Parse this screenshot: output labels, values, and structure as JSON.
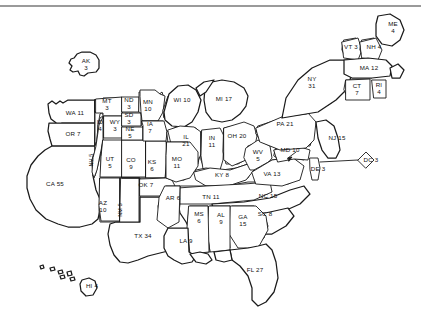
{
  "figure": {
    "type": "cartogram-map",
    "title": "",
    "background_color": "#ffffff",
    "outline_color": "#1a1a1a",
    "rule_color": "#9a9a9a",
    "total_electoral_votes": 538
  },
  "chart_data": {
    "type": "map",
    "title": "",
    "value_label": "Electoral Votes",
    "states": [
      {
        "abbr": "AK",
        "value": 3,
        "layout": "stacked",
        "x": 86,
        "y": 65
      },
      {
        "abbr": "WA",
        "value": 11,
        "layout": "inline",
        "x": 75,
        "y": 113
      },
      {
        "abbr": "OR",
        "value": 7,
        "layout": "inline",
        "x": 73,
        "y": 134
      },
      {
        "abbr": "MT",
        "value": 3,
        "layout": "stacked",
        "x": 107,
        "y": 105
      },
      {
        "abbr": "ND",
        "value": 3,
        "layout": "stacked",
        "x": 129,
        "y": 104
      },
      {
        "abbr": "MN",
        "value": 10,
        "layout": "stacked",
        "x": 148,
        "y": 106
      },
      {
        "abbr": "WI",
        "value": 10,
        "layout": "inline",
        "x": 182,
        "y": 100
      },
      {
        "abbr": "MI",
        "value": 17,
        "layout": "inline",
        "x": 224,
        "y": 99
      },
      {
        "abbr": "ID",
        "value": 4,
        "layout": "stacked",
        "x": 100,
        "y": 126
      },
      {
        "abbr": "WY",
        "value": 3,
        "layout": "stacked",
        "x": 115,
        "y": 126
      },
      {
        "abbr": "SD",
        "value": 3,
        "layout": "stacked",
        "x": 129,
        "y": 119
      },
      {
        "abbr": "NE",
        "value": 5,
        "layout": "stacked",
        "x": 130,
        "y": 133
      },
      {
        "abbr": "IA",
        "value": 7,
        "layout": "stacked",
        "x": 150,
        "y": 128
      },
      {
        "abbr": "IL",
        "value": 21,
        "layout": "stacked",
        "x": 186,
        "y": 141
      },
      {
        "abbr": "IN",
        "value": 11,
        "layout": "stacked",
        "x": 212,
        "y": 142
      },
      {
        "abbr": "OH",
        "value": 20,
        "layout": "inline",
        "x": 237,
        "y": 136
      },
      {
        "abbr": "PA",
        "value": 21,
        "layout": "inline",
        "x": 285,
        "y": 124
      },
      {
        "abbr": "NY",
        "value": 31,
        "layout": "stacked",
        "x": 312,
        "y": 83
      },
      {
        "abbr": "VT",
        "value": 3,
        "layout": "inline",
        "x": 351,
        "y": 47
      },
      {
        "abbr": "NH",
        "value": 4,
        "layout": "inline",
        "x": 374,
        "y": 47
      },
      {
        "abbr": "ME",
        "value": 4,
        "layout": "stacked",
        "x": 393,
        "y": 28
      },
      {
        "abbr": "MA",
        "value": 12,
        "layout": "inline",
        "x": 369,
        "y": 68
      },
      {
        "abbr": "CT",
        "value": 7,
        "layout": "stacked",
        "x": 357,
        "y": 90
      },
      {
        "abbr": "RI",
        "value": 4,
        "layout": "stacked",
        "x": 379,
        "y": 89
      },
      {
        "abbr": "NJ",
        "value": 15,
        "layout": "inline",
        "x": 337,
        "y": 138
      },
      {
        "abbr": "NV",
        "value": 5,
        "layout": "vertical",
        "x": 92,
        "y": 160
      },
      {
        "abbr": "UT",
        "value": 5,
        "layout": "stacked",
        "x": 110,
        "y": 163
      },
      {
        "abbr": "CO",
        "value": 9,
        "layout": "stacked",
        "x": 131,
        "y": 164
      },
      {
        "abbr": "KS",
        "value": 6,
        "layout": "stacked",
        "x": 152,
        "y": 166
      },
      {
        "abbr": "MO",
        "value": 11,
        "layout": "stacked",
        "x": 177,
        "y": 163
      },
      {
        "abbr": "KY",
        "value": 8,
        "layout": "inline",
        "x": 222,
        "y": 175
      },
      {
        "abbr": "WV",
        "value": 5,
        "layout": "stacked",
        "x": 258,
        "y": 156
      },
      {
        "abbr": "VA",
        "value": 13,
        "layout": "inline",
        "x": 272,
        "y": 174
      },
      {
        "abbr": "MD",
        "value": 10,
        "layout": "inline",
        "x": 290,
        "y": 150
      },
      {
        "abbr": "DE",
        "value": 3,
        "layout": "inline",
        "x": 318,
        "y": 169
      },
      {
        "abbr": "DC",
        "value": 3,
        "layout": "inline",
        "x": 371,
        "y": 160
      },
      {
        "abbr": "NC",
        "value": 15,
        "layout": "inline",
        "x": 268,
        "y": 196
      },
      {
        "abbr": "TN",
        "value": 11,
        "layout": "inline",
        "x": 211,
        "y": 197
      },
      {
        "abbr": "AR",
        "value": 6,
        "layout": "inline",
        "x": 173,
        "y": 198
      },
      {
        "abbr": "OK",
        "value": 7,
        "layout": "inline",
        "x": 146,
        "y": 185
      },
      {
        "abbr": "AZ",
        "value": 10,
        "layout": "stacked",
        "x": 103,
        "y": 207
      },
      {
        "abbr": "NM",
        "value": 5,
        "layout": "vertical",
        "x": 121,
        "y": 210
      },
      {
        "abbr": "CA",
        "value": 55,
        "layout": "inline",
        "x": 55,
        "y": 184
      },
      {
        "abbr": "TX",
        "value": 34,
        "layout": "inline",
        "x": 143,
        "y": 236
      },
      {
        "abbr": "LA",
        "value": 9,
        "layout": "inline",
        "x": 186,
        "y": 241
      },
      {
        "abbr": "MS",
        "value": 6,
        "layout": "stacked",
        "x": 199,
        "y": 218
      },
      {
        "abbr": "AL",
        "value": 9,
        "layout": "stacked",
        "x": 221,
        "y": 219
      },
      {
        "abbr": "GA",
        "value": 15,
        "layout": "stacked",
        "x": 243,
        "y": 221
      },
      {
        "abbr": "SC",
        "value": 8,
        "layout": "inline",
        "x": 265,
        "y": 214
      },
      {
        "abbr": "FL",
        "value": 27,
        "layout": "inline",
        "x": 255,
        "y": 270
      },
      {
        "abbr": "HI",
        "value": 4,
        "layout": "inline",
        "x": 92,
        "y": 286
      }
    ]
  }
}
